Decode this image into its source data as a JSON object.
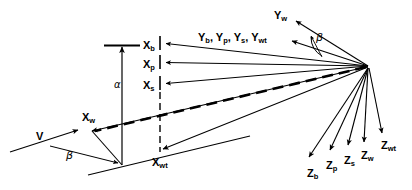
{
  "figure": {
    "type": "vector-axes-diagram",
    "background_color": "#ffffff",
    "stroke_color": "#000000"
  },
  "labels": {
    "x_b": {
      "base": "X",
      "sub": "b",
      "x": 143,
      "y": 40
    },
    "x_p": {
      "base": "X",
      "sub": "p",
      "x": 143,
      "y": 59
    },
    "x_s": {
      "base": "X",
      "sub": "s",
      "x": 143,
      "y": 80
    },
    "x_w": {
      "base": "X",
      "sub": "w",
      "x": 82,
      "y": 112
    },
    "x_wt": {
      "base": "X",
      "sub": "wt",
      "x": 152,
      "y": 157
    },
    "y_w": {
      "base": "Y",
      "sub": "w",
      "x": 274,
      "y": 10
    },
    "y_group": {
      "text": "Y",
      "x": 198,
      "y": 32
    },
    "z_b": {
      "base": "Z",
      "sub": "b",
      "x": 307,
      "y": 168
    },
    "z_p": {
      "base": "Z",
      "sub": "p",
      "x": 326,
      "y": 160
    },
    "z_s": {
      "base": "Z",
      "sub": "s",
      "x": 344,
      "y": 155
    },
    "z_w": {
      "base": "Z",
      "sub": "w",
      "x": 361,
      "y": 150
    },
    "z_wt": {
      "base": "Z",
      "sub": "wt",
      "x": 381,
      "y": 140
    },
    "v": {
      "text": "V",
      "x": 36,
      "y": 131
    },
    "alpha": {
      "text": "α",
      "x": 114,
      "y": 80
    },
    "beta_lower": {
      "text": "β",
      "x": 66,
      "y": 150
    },
    "beta_upper": {
      "text": "β",
      "x": 316,
      "y": 32
    }
  },
  "y_axis_group": {
    "items": [
      "Y",
      "b",
      "Y",
      "p",
      "Y",
      "s",
      "Y",
      "wt"
    ],
    "rendered": "Yb, Yp, Ys, Ywt"
  },
  "axes": {
    "x_labels": [
      "X_b",
      "X_p",
      "X_s",
      "X_w",
      "X_wt"
    ],
    "y_labels": [
      "Y_w",
      "Y_b",
      "Y_p",
      "Y_s",
      "Y_wt"
    ],
    "z_labels": [
      "Z_b",
      "Z_p",
      "Z_s",
      "Z_w",
      "Z_wt"
    ],
    "angles": [
      "alpha",
      "beta"
    ],
    "vectors": [
      "V"
    ]
  },
  "geometry": {
    "apex": {
      "x": 368,
      "y": 66
    },
    "alpha_arrow": {
      "x": 122,
      "y_top": 45,
      "y_bottom": 165
    },
    "cap_bar": {
      "x1": 104,
      "x2": 140,
      "y": 45
    }
  }
}
